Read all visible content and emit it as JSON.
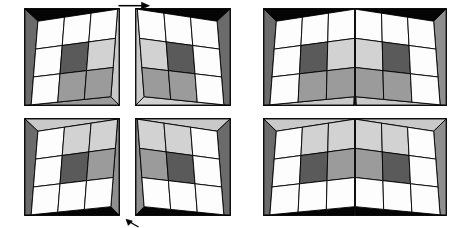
{
  "figure": {
    "background_color": "#ffffff",
    "width": 457,
    "height": 228,
    "rows": 2,
    "columns": 3
  },
  "palette": {
    "outline": "#000000",
    "border": "#1a1a1a",
    "white_cell": "#fdfdfd",
    "light_cell": "#d2d2d2",
    "mid_cell": "#9b9b9b",
    "dark_cell": "#5a5a5a",
    "darker_cell": "#6e6e6e",
    "black_wedge": "#050505",
    "grey_wedge_dark": "#6b6b6b",
    "grey_wedge_mid": "#8f8f8f",
    "grey_wedge_light": "#c9c9c9",
    "grey_wedge_pale": "#dcdcdc",
    "seam": "#111111"
  },
  "panels": [
    {
      "id": "panel-top-left",
      "name": "top-left-half-card",
      "row": "top",
      "column": 1,
      "kind": "single-half",
      "fold_side": "right",
      "wedge_top_color": "#050505",
      "wedge_bottom_color": "#9b9b9b",
      "wedge_left_color": "#6b6b6b",
      "wedge_right_color": "#c9c9c9",
      "x": 24,
      "y": 8,
      "w": 96,
      "h": 98,
      "checker": [
        [
          "#fdfdfd",
          "#fdfdfd",
          "#fdfdfd"
        ],
        [
          "#fdfdfd",
          "#5a5a5a",
          "#d2d2d2"
        ],
        [
          "#fdfdfd",
          "#9b9b9b",
          "#9b9b9b"
        ]
      ]
    },
    {
      "id": "panel-top-mid",
      "name": "top-middle-half-card",
      "row": "top",
      "column": 2,
      "kind": "single-half",
      "fold_side": "left",
      "wedge_top_color": "#050505",
      "wedge_bottom_color": "#d2d2d2",
      "wedge_left_color": "#c9c9c9",
      "wedge_right_color": "#6b6b6b",
      "x": 135,
      "y": 8,
      "w": 96,
      "h": 98,
      "checker": [
        [
          "#fdfdfd",
          "#fdfdfd",
          "#fdfdfd"
        ],
        [
          "#d2d2d2",
          "#5a5a5a",
          "#fdfdfd"
        ],
        [
          "#9b9b9b",
          "#9b9b9b",
          "#fdfdfd"
        ]
      ]
    },
    {
      "id": "panel-top-wide",
      "name": "top-joined-card-tent-fold",
      "row": "top",
      "column": 3,
      "kind": "joined-pair",
      "fold_direction": "convex-toward-viewer",
      "wedge_top_color": "#050505",
      "wedge_bottom_color": "#c9c9c9",
      "wedge_left_color": "#6b6b6b",
      "wedge_right_color": "#8f8f8f",
      "x": 263,
      "y": 8,
      "w": 184,
      "h": 98,
      "checker_left": [
        [
          "#fdfdfd",
          "#fdfdfd",
          "#fdfdfd"
        ],
        [
          "#fdfdfd",
          "#5a5a5a",
          "#d2d2d2"
        ],
        [
          "#fdfdfd",
          "#9b9b9b",
          "#9b9b9b"
        ]
      ],
      "checker_right": [
        [
          "#fdfdfd",
          "#fdfdfd",
          "#fdfdfd"
        ],
        [
          "#d2d2d2",
          "#5a5a5a",
          "#fdfdfd"
        ],
        [
          "#9b9b9b",
          "#9b9b9b",
          "#fdfdfd"
        ]
      ]
    },
    {
      "id": "panel-bottom-left",
      "name": "bottom-left-half-card",
      "row": "bottom",
      "column": 1,
      "kind": "single-half",
      "fold_side": "right",
      "wedge_top_color": "#c9c9c9",
      "wedge_bottom_color": "#050505",
      "wedge_left_color": "#6b6b6b",
      "wedge_right_color": "#8f8f8f",
      "x": 24,
      "y": 118,
      "w": 96,
      "h": 98,
      "checker": [
        [
          "#fdfdfd",
          "#d2d2d2",
          "#d2d2d2"
        ],
        [
          "#fdfdfd",
          "#5a5a5a",
          "#9b9b9b"
        ],
        [
          "#fdfdfd",
          "#fdfdfd",
          "#fdfdfd"
        ]
      ]
    },
    {
      "id": "panel-bottom-mid",
      "name": "bottom-middle-half-card",
      "row": "bottom",
      "column": 2,
      "kind": "single-half",
      "fold_side": "left",
      "wedge_top_color": "#c9c9c9",
      "wedge_bottom_color": "#050505",
      "wedge_left_color": "#8f8f8f",
      "wedge_right_color": "#6b6b6b",
      "x": 135,
      "y": 118,
      "w": 96,
      "h": 98,
      "checker": [
        [
          "#d2d2d2",
          "#d2d2d2",
          "#fdfdfd"
        ],
        [
          "#9b9b9b",
          "#5a5a5a",
          "#fdfdfd"
        ],
        [
          "#fdfdfd",
          "#fdfdfd",
          "#fdfdfd"
        ]
      ]
    },
    {
      "id": "panel-bottom-wide",
      "name": "bottom-joined-card-valley-fold",
      "row": "bottom",
      "column": 3,
      "kind": "joined-pair",
      "fold_direction": "concave-away-from-viewer",
      "wedge_top_color": "#c9c9c9",
      "wedge_bottom_color": "#050505",
      "wedge_left_color": "#6b6b6b",
      "wedge_right_color": "#8f8f8f",
      "x": 263,
      "y": 118,
      "w": 184,
      "h": 98,
      "checker_left": [
        [
          "#fdfdfd",
          "#d2d2d2",
          "#d2d2d2"
        ],
        [
          "#fdfdfd",
          "#5a5a5a",
          "#9b9b9b"
        ],
        [
          "#fdfdfd",
          "#fdfdfd",
          "#fdfdfd"
        ]
      ],
      "checker_right": [
        [
          "#d2d2d2",
          "#d2d2d2",
          "#fdfdfd"
        ],
        [
          "#9b9b9b",
          "#5a5a5a",
          "#fdfdfd"
        ],
        [
          "#fdfdfd",
          "#fdfdfd",
          "#fdfdfd"
        ]
      ]
    }
  ],
  "annotations": [
    {
      "id": "arrow-top",
      "name": "top-fold-direction-arrow",
      "glyph": "arrow-right-icon",
      "direction": "right",
      "x": 118,
      "y": 1,
      "w": 32,
      "h": 9,
      "color": "#000000"
    },
    {
      "id": "arrow-bottom",
      "name": "bottom-fold-direction-arrow",
      "glyph": "arrow-up-left-icon",
      "direction": "up-left",
      "x": 124,
      "y": 218,
      "w": 16,
      "h": 10,
      "color": "#000000"
    }
  ]
}
